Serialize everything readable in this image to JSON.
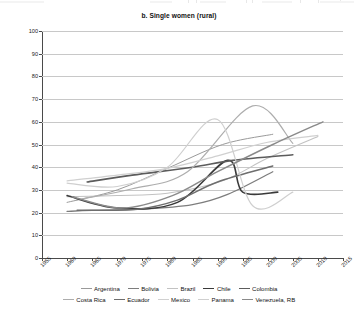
{
  "chart_data": {
    "type": "line",
    "title": "b. Single women (rural)",
    "xlabel": "",
    "ylabel": "Percent",
    "xlim": [
      1955,
      2015
    ],
    "ylim": [
      0,
      100
    ],
    "xticks": [
      "1955",
      "1960",
      "1965",
      "1970",
      "1975",
      "1980",
      "1985",
      "1990",
      "1995",
      "2000",
      "2005",
      "2010",
      "2015"
    ],
    "yticks": [
      "0",
      "10",
      "20",
      "30",
      "40",
      "50",
      "60",
      "70",
      "80",
      "90",
      "100"
    ],
    "grid": "horizontal",
    "legend_position": "bottom",
    "series": [
      {
        "name": "Argentina",
        "color": "#9a9a9a",
        "width": 1.0,
        "x": [
          1960,
          1970,
          1980,
          1991,
          2001
        ],
        "values": [
          24.5,
          30.0,
          39.5,
          50.0,
          54.5
        ]
      },
      {
        "name": "Bolivia",
        "color": "#7d7d7d",
        "width": 1.3,
        "x": [
          1960,
          1965,
          1975,
          1985,
          1992,
          2001
        ],
        "values": [
          20.5,
          21.0,
          21.5,
          23.5,
          28.0,
          38.0
        ]
      },
      {
        "name": "Brazil",
        "color": "#c2c2c2",
        "width": 1.1,
        "x": [
          1960,
          1970,
          1980,
          1991,
          2000,
          2010
        ],
        "values": [
          27.0,
          27.5,
          28.5,
          34.0,
          44.0,
          53.5
        ]
      },
      {
        "name": "Chile",
        "color": "#3a3a3a",
        "width": 1.6,
        "x": [
          1960,
          1970,
          1982,
          1992,
          1995,
          2002
        ],
        "values": [
          27.5,
          22.0,
          24.5,
          43.0,
          29.0,
          29.0
        ]
      },
      {
        "name": "Colombia",
        "color": "#5c5c5c",
        "width": 1.6,
        "x": [
          1964,
          1973,
          1985,
          1993,
          2005
        ],
        "values": [
          33.5,
          36.5,
          40.0,
          43.0,
          45.5
        ]
      },
      {
        "name": "Costa Rica",
        "color": "#adadad",
        "width": 1.2,
        "x": [
          1963,
          1973,
          1984,
          1997,
          2005
        ],
        "values": [
          26.0,
          30.5,
          38.0,
          67.0,
          50.5
        ]
      },
      {
        "name": "Ecuador",
        "color": "#6e6e6e",
        "width": 1.5,
        "x": [
          1962,
          1974,
          1982,
          1990,
          2001
        ],
        "values": [
          21.0,
          21.5,
          25.5,
          33.5,
          40.5
        ]
      },
      {
        "name": "Mexico",
        "color": "#d0d0d0",
        "width": 1.2,
        "x": [
          1960,
          1970,
          1980,
          1990,
          2000,
          2010
        ],
        "values": [
          34.0,
          36.5,
          39.5,
          45.0,
          51.0,
          54.0
        ]
      },
      {
        "name": "Panama",
        "color": "#cfcfcf",
        "width": 1.2,
        "x": [
          1960,
          1970,
          1980,
          1990,
          1997,
          2005
        ],
        "values": [
          33.0,
          31.5,
          40.0,
          61.0,
          23.0,
          29.0
        ]
      },
      {
        "name": "Venezuela, RB",
        "color": "#8a8a8a",
        "width": 1.4,
        "x": [
          1961,
          1971,
          1981,
          1990,
          2001,
          2011
        ],
        "values": [
          27.0,
          22.0,
          27.5,
          38.0,
          50.0,
          60.0
        ]
      }
    ]
  },
  "legend": {
    "rows": [
      [
        "Argentina",
        "Bolivia",
        "Brazil",
        "Chile",
        "Colombia"
      ],
      [
        "Costa Rica",
        "Ecuador",
        "Mexico",
        "Panama",
        "Venezuela, RB"
      ]
    ]
  }
}
